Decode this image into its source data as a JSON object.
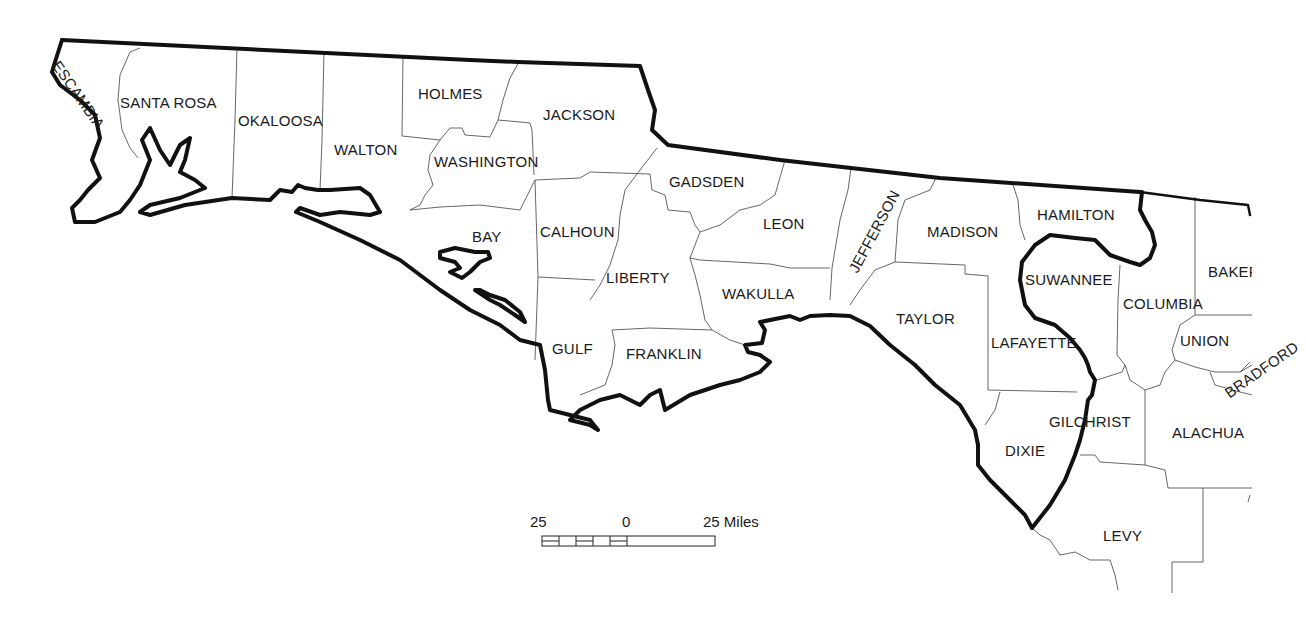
{
  "map": {
    "title": "Florida Panhandle and North Florida Counties",
    "counties": [
      {
        "name": "ESCAMBIA",
        "x": 55,
        "y": 60,
        "rotate": 55
      },
      {
        "name": "SANTA ROSA",
        "x": 120,
        "y": 95,
        "rotate": 0
      },
      {
        "name": "OKALOOSA",
        "x": 238,
        "y": 113,
        "rotate": 0
      },
      {
        "name": "WALTON",
        "x": 334,
        "y": 142,
        "rotate": 0
      },
      {
        "name": "HOLMES",
        "x": 418,
        "y": 86,
        "rotate": 0
      },
      {
        "name": "JACKSON",
        "x": 543,
        "y": 107,
        "rotate": 0
      },
      {
        "name": "WASHINGTON",
        "x": 434,
        "y": 154,
        "rotate": 0
      },
      {
        "name": "GADSDEN",
        "x": 669,
        "y": 174,
        "rotate": 0
      },
      {
        "name": "BAY",
        "x": 472,
        "y": 229,
        "rotate": 0
      },
      {
        "name": "CALHOUN",
        "x": 540,
        "y": 224,
        "rotate": 0
      },
      {
        "name": "LEON",
        "x": 763,
        "y": 216,
        "rotate": 0
      },
      {
        "name": "JEFFERSON",
        "x": 843,
        "y": 265,
        "rotate": -62
      },
      {
        "name": "MADISON",
        "x": 927,
        "y": 224,
        "rotate": 0
      },
      {
        "name": "HAMILTON",
        "x": 1037,
        "y": 207,
        "rotate": 0
      },
      {
        "name": "LIBERTY",
        "x": 606,
        "y": 270,
        "rotate": 0
      },
      {
        "name": "WAKULLA",
        "x": 722,
        "y": 286,
        "rotate": 0
      },
      {
        "name": "SUWANNEE",
        "x": 1025,
        "y": 272,
        "rotate": 0
      },
      {
        "name": "BAKER",
        "x": 1208,
        "y": 264,
        "rotate": 0
      },
      {
        "name": "COLUMBIA",
        "x": 1123,
        "y": 296,
        "rotate": 0
      },
      {
        "name": "TAYLOR",
        "x": 896,
        "y": 311,
        "rotate": 0
      },
      {
        "name": "UNION",
        "x": 1180,
        "y": 333,
        "rotate": 0
      },
      {
        "name": "LAFAYETTE",
        "x": 991,
        "y": 335,
        "rotate": 0
      },
      {
        "name": "GULF",
        "x": 552,
        "y": 341,
        "rotate": 0
      },
      {
        "name": "FRANKLIN",
        "x": 626,
        "y": 346,
        "rotate": 0
      },
      {
        "name": "BRADFORD",
        "x": 1222,
        "y": 385,
        "rotate": -35
      },
      {
        "name": "GILCHRIST",
        "x": 1049,
        "y": 414,
        "rotate": 0
      },
      {
        "name": "ALACHUA",
        "x": 1172,
        "y": 425,
        "rotate": 0
      },
      {
        "name": "DIXIE",
        "x": 1005,
        "y": 443,
        "rotate": 0
      },
      {
        "name": "LEVY",
        "x": 1103,
        "y": 528,
        "rotate": 0
      }
    ]
  },
  "scale_bar": {
    "left_label": "25",
    "center_label": "0",
    "right_label": "25 Miles",
    "units": "Miles"
  },
  "colors": {
    "state_boundary": "#111111",
    "county_boundary": "#555555",
    "background": "#ffffff",
    "text": "#1a1a1a"
  }
}
